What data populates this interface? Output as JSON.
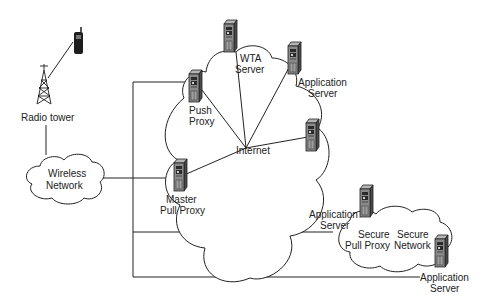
{
  "diagram": {
    "type": "network-architecture",
    "colors": {
      "line": "#222222",
      "server_body": "#8a8a8a",
      "server_dark": "#3a3a3a",
      "background": "#ffffff"
    },
    "nodes": {
      "phone": {
        "label": "",
        "icon": "mobile-phone-icon"
      },
      "radio_tower": {
        "label": "Radio tower",
        "icon": "radio-tower-icon"
      },
      "wireless_network": {
        "label_line1": "Wireless",
        "label_line2": "Network",
        "icon": "cloud-icon"
      },
      "internet": {
        "label": "Internet",
        "icon": "cloud-icon"
      },
      "push_proxy": {
        "label_line1": "Push",
        "label_line2": "Proxy",
        "icon": "server-icon"
      },
      "wta_server": {
        "label_line1": "WTA",
        "label_line2": "Server",
        "icon": "server-icon"
      },
      "app_server_top": {
        "label_line1": "Application",
        "label_line2": "Server",
        "icon": "server-icon"
      },
      "app_server_right": {
        "label": "",
        "icon": "server-icon"
      },
      "master_pull_proxy": {
        "label_line1": "Master",
        "label_line2": "Pull Proxy",
        "icon": "server-icon"
      },
      "app_server_mid": {
        "label_line1": "Application",
        "label_line2": "Server",
        "icon": "server-icon"
      },
      "secure_network": {
        "label_line1": "Secure",
        "label_line2": "Network",
        "icon": "cloud-icon"
      },
      "secure_pull_proxy": {
        "label_line1": "Secure",
        "label_line2": "Pull Proxy"
      },
      "app_server_bottom": {
        "label_line1": "Application",
        "label_line2": "Server",
        "icon": "server-icon"
      }
    },
    "edges": [
      {
        "from": "phone",
        "to": "radio_tower"
      },
      {
        "from": "radio_tower",
        "to": "wireless_network"
      },
      {
        "from": "wireless_network",
        "to": "master_pull_proxy"
      },
      {
        "from": "push_proxy",
        "to": "bus_left"
      },
      {
        "from": "internet_hub",
        "to": "push_proxy"
      },
      {
        "from": "internet_hub",
        "to": "wta_server"
      },
      {
        "from": "internet_hub",
        "to": "app_server_top"
      },
      {
        "from": "internet_hub",
        "to": "app_server_right"
      },
      {
        "from": "internet_hub",
        "to": "master_pull_proxy"
      },
      {
        "from": "bus_left",
        "to": "app_server_mid"
      },
      {
        "from": "bus_left",
        "to": "app_server_bottom"
      }
    ]
  }
}
